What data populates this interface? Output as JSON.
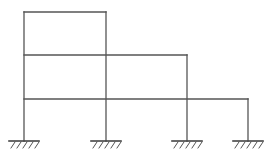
{
  "diagram": {
    "type": "structural-frame",
    "stroke_color": "#555555",
    "background": "#ffffff",
    "columns": [
      {
        "id": "col-1",
        "x": 24,
        "y_top": 12,
        "y_bottom": 141
      },
      {
        "id": "col-2",
        "x": 106,
        "y_top": 12,
        "y_bottom": 141
      },
      {
        "id": "col-3",
        "x": 187,
        "y_top": 55,
        "y_bottom": 141
      },
      {
        "id": "col-4",
        "x": 248,
        "y_top": 99,
        "y_bottom": 141
      }
    ],
    "beams": [
      {
        "id": "beam-level-3",
        "y": 12,
        "x_start": 24,
        "x_end": 106
      },
      {
        "id": "beam-level-2",
        "y": 55,
        "x_start": 24,
        "x_end": 187
      },
      {
        "id": "beam-level-1",
        "y": 99,
        "x_start": 24,
        "x_end": 248
      }
    ],
    "supports": [
      {
        "id": "support-1",
        "type": "fixed",
        "x": 24,
        "y": 141
      },
      {
        "id": "support-2",
        "type": "fixed",
        "x": 106,
        "y": 141
      },
      {
        "id": "support-3",
        "type": "fixed",
        "x": 187,
        "y": 141
      },
      {
        "id": "support-4",
        "type": "fixed",
        "x": 248,
        "y": 141
      }
    ],
    "support_half_width": 15,
    "hatch_count": 5,
    "hatch_length": 7
  }
}
